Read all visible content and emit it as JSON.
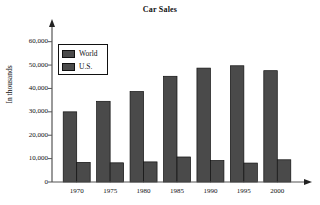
{
  "chart_data": {
    "type": "bar",
    "title": "Car Sales",
    "xlabel": "",
    "ylabel": "In thousands",
    "categories": [
      "1970",
      "1975",
      "1980",
      "1985",
      "1990",
      "1995",
      "2000"
    ],
    "series": [
      {
        "name": "World",
        "color": "#4a4a4a",
        "values": [
          30000,
          34500,
          38700,
          45200,
          48700,
          49700,
          47600
        ]
      },
      {
        "name": "U.S.",
        "color": "#4a4a4a",
        "values": [
          8400,
          8200,
          8600,
          10700,
          9200,
          8100,
          9500
        ]
      }
    ],
    "ylim": [
      0,
      62000
    ],
    "yticks": [
      0,
      10000,
      20000,
      30000,
      40000,
      50000,
      60000
    ],
    "ytick_labels": [
      "0",
      "10,000",
      "20,000",
      "30,000",
      "40,000",
      "50,000",
      "60,000"
    ],
    "grid": false,
    "legend_position": "upper-left-inside",
    "axis_color": "#555555",
    "bar_edge_color": "#111111",
    "background": "#ffffff"
  }
}
